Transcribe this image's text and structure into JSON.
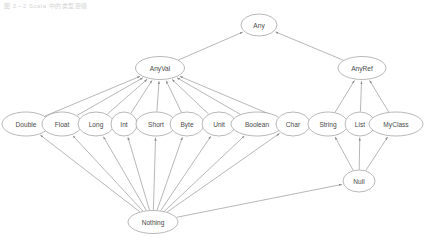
{
  "caption": "图 2－2  Scala 中的类型层级",
  "diagram": {
    "viewbox": "0 0 426 244",
    "colors": {
      "node_stroke": "#9a9a9a",
      "node_fill": "#ffffff",
      "label_text": "#4a4a4a",
      "edge_stroke": "#8f8f8f",
      "background": "#ffffff"
    },
    "nodes": [
      {
        "id": "any",
        "label": "Any",
        "cx": 259,
        "cy": 25,
        "rx": 18,
        "ry": 11
      },
      {
        "id": "anyval",
        "label": "AnyVal",
        "cx": 160,
        "cy": 68,
        "rx": 24.5,
        "ry": 11.5
      },
      {
        "id": "anyref",
        "label": "AnyRef",
        "cx": 362,
        "cy": 68,
        "rx": 24,
        "ry": 11.5
      },
      {
        "id": "double",
        "label": "Double",
        "cx": 26,
        "cy": 124,
        "rx": 24,
        "ry": 12
      },
      {
        "id": "float",
        "label": "Float",
        "cx": 62,
        "cy": 124,
        "rx": 20,
        "ry": 12
      },
      {
        "id": "long",
        "label": "Long",
        "cx": 96,
        "cy": 124,
        "rx": 18,
        "ry": 12
      },
      {
        "id": "int",
        "label": "Int",
        "cx": 124,
        "cy": 124,
        "rx": 13,
        "ry": 12
      },
      {
        "id": "short",
        "label": "Short",
        "cx": 156,
        "cy": 124,
        "rx": 20,
        "ry": 12
      },
      {
        "id": "byte",
        "label": "Byte",
        "cx": 187,
        "cy": 124,
        "rx": 17,
        "ry": 12
      },
      {
        "id": "unit",
        "label": "Unit",
        "cx": 219,
        "cy": 124,
        "rx": 17,
        "ry": 12
      },
      {
        "id": "boolean",
        "label": "Boolean",
        "cx": 257,
        "cy": 124,
        "rx": 26,
        "ry": 12
      },
      {
        "id": "char",
        "label": "Char",
        "cx": 293,
        "cy": 124,
        "rx": 17,
        "ry": 12
      },
      {
        "id": "string",
        "label": "String",
        "cx": 328,
        "cy": 124,
        "rx": 20,
        "ry": 12
      },
      {
        "id": "list",
        "label": "List",
        "cx": 360,
        "cy": 124,
        "rx": 15,
        "ry": 12
      },
      {
        "id": "myclass",
        "label": "MyClass",
        "cx": 396,
        "cy": 124,
        "rx": 27,
        "ry": 12
      },
      {
        "id": "null",
        "label": "Null",
        "cx": 359,
        "cy": 181,
        "rx": 16,
        "ry": 11
      },
      {
        "id": "nothing",
        "label": "Nothing",
        "cx": 153,
        "cy": 222,
        "rx": 25,
        "ry": 11.5
      }
    ],
    "edges": [
      {
        "from": "anyval",
        "to": "any"
      },
      {
        "from": "anyref",
        "to": "any"
      },
      {
        "from": "double",
        "to": "anyval"
      },
      {
        "from": "float",
        "to": "anyval"
      },
      {
        "from": "long",
        "to": "anyval"
      },
      {
        "from": "int",
        "to": "anyval"
      },
      {
        "from": "short",
        "to": "anyval"
      },
      {
        "from": "byte",
        "to": "anyval"
      },
      {
        "from": "unit",
        "to": "anyval"
      },
      {
        "from": "boolean",
        "to": "anyval"
      },
      {
        "from": "char",
        "to": "anyval"
      },
      {
        "from": "string",
        "to": "anyref"
      },
      {
        "from": "list",
        "to": "anyref"
      },
      {
        "from": "myclass",
        "to": "anyref"
      },
      {
        "from": "null",
        "to": "string"
      },
      {
        "from": "null",
        "to": "list"
      },
      {
        "from": "null",
        "to": "myclass"
      },
      {
        "from": "nothing",
        "to": "double"
      },
      {
        "from": "nothing",
        "to": "float"
      },
      {
        "from": "nothing",
        "to": "long"
      },
      {
        "from": "nothing",
        "to": "int"
      },
      {
        "from": "nothing",
        "to": "short"
      },
      {
        "from": "nothing",
        "to": "byte"
      },
      {
        "from": "nothing",
        "to": "unit"
      },
      {
        "from": "nothing",
        "to": "boolean"
      },
      {
        "from": "nothing",
        "to": "char"
      },
      {
        "from": "nothing",
        "to": "null"
      }
    ]
  }
}
